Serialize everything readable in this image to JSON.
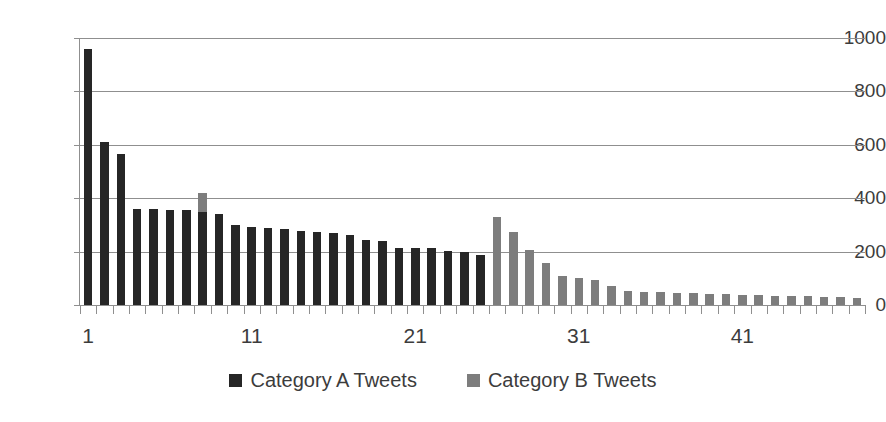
{
  "chart_data": {
    "type": "bar",
    "title": "",
    "subtitle": "",
    "xlabel": "",
    "ylabel": "",
    "ylim": [
      0,
      1000
    ],
    "yticks": [
      0,
      200,
      400,
      600,
      800,
      1000
    ],
    "xticks": [
      1,
      11,
      21,
      31,
      41
    ],
    "xtick_labels": [
      "1",
      "11",
      "21",
      "31",
      "41"
    ],
    "grid": "horizontal",
    "legend_position": "bottom-center",
    "x": [
      1,
      2,
      3,
      4,
      5,
      6,
      7,
      8,
      9,
      10,
      11,
      12,
      13,
      14,
      15,
      16,
      17,
      18,
      19,
      20,
      21,
      22,
      23,
      24,
      25,
      26,
      27,
      28,
      29,
      30,
      31,
      32,
      33,
      34,
      35,
      36,
      37,
      38,
      39,
      40,
      41,
      42,
      43,
      44,
      45,
      46,
      47,
      48
    ],
    "series": [
      {
        "name": "Category A Tweets",
        "color": "#262626",
        "values": [
          960,
          610,
          565,
          360,
          358,
          356,
          355,
          350,
          342,
          300,
          293,
          288,
          285,
          278,
          275,
          270,
          262,
          245,
          238,
          215,
          212,
          213,
          203,
          200,
          188,
          null,
          null,
          null,
          null,
          null,
          null,
          null,
          null,
          null,
          null,
          null,
          null,
          null,
          null,
          null,
          null,
          null,
          null,
          null,
          null,
          null,
          null,
          null
        ]
      },
      {
        "name": "Category B Tweets",
        "color": "#7d7d7d",
        "values": [
          null,
          null,
          null,
          null,
          null,
          null,
          null,
          420,
          null,
          null,
          null,
          null,
          null,
          null,
          null,
          null,
          null,
          null,
          null,
          null,
          null,
          null,
          null,
          null,
          null,
          330,
          272,
          205,
          158,
          108,
          100,
          95,
          72,
          52,
          50,
          49,
          45,
          44,
          42,
          40,
          38,
          36,
          34,
          33,
          32,
          31,
          30,
          28
        ]
      }
    ]
  },
  "legend": {
    "items": [
      {
        "label": "Category A Tweets",
        "color": "#262626",
        "swatch": "square-dark"
      },
      {
        "label": "Category B Tweets",
        "color": "#7d7d7d",
        "swatch": "square-gray"
      }
    ]
  },
  "axes": {
    "y": {
      "labels": [
        "1000",
        "800",
        "600",
        "400",
        "200",
        "0"
      ],
      "values": [
        1000,
        800,
        600,
        400,
        200,
        0
      ]
    },
    "x": {
      "labels": [
        "1",
        "11",
        "21",
        "31",
        "41"
      ],
      "values": [
        1,
        11,
        21,
        31,
        41
      ]
    }
  },
  "colors": {
    "series_a": "#262626",
    "series_b": "#7d7d7d",
    "gridline": "#8f8f8f",
    "text": "#3c3c3c",
    "background": "#ffffff"
  }
}
